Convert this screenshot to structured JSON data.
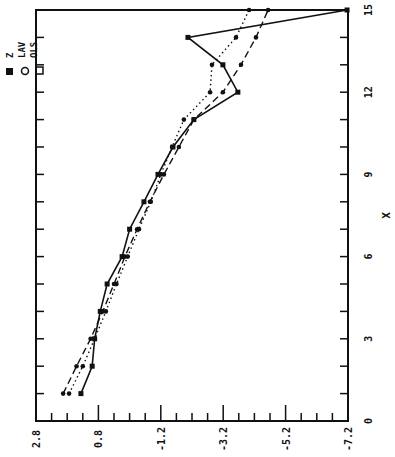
{
  "chart_data": {
    "type": "line",
    "orientation": "rotated-90",
    "title": "",
    "xlabel": "X",
    "ylabel": "",
    "xlim": [
      0,
      15
    ],
    "ylim": [
      2.8,
      -7.2
    ],
    "x_ticks": [
      "0",
      "3",
      "6",
      "9",
      "12",
      "15"
    ],
    "y_ticks": [
      "2.8",
      "0.8",
      "-1.2",
      "-3.2",
      "-5.2",
      "-7.2"
    ],
    "grid": false,
    "legend_position": "top-left",
    "x": [
      1,
      2,
      3,
      4,
      5,
      6,
      7,
      8,
      9,
      10,
      11,
      12,
      13,
      14,
      15
    ],
    "series": [
      {
        "name": "Z",
        "style": "solid",
        "marker": "filled-square",
        "values": [
          1.36,
          1.0,
          0.92,
          0.74,
          0.52,
          0.04,
          -0.2,
          -0.66,
          -1.11,
          -1.59,
          -2.26,
          -3.67,
          -3.19,
          -2.07,
          -7.17
        ]
      },
      {
        "name": "LAV",
        "style": "dashed",
        "marker": "circle",
        "values": [
          1.93,
          1.5,
          1.05,
          0.66,
          0.3,
          -0.05,
          -0.44,
          -0.85,
          -1.3,
          -1.78,
          -2.26,
          -3.19,
          -3.77,
          -4.25,
          -4.64
        ]
      },
      {
        "name": "OLS",
        "style": "dotted",
        "marker": "open-square",
        "values": [
          1.74,
          1.3,
          0.92,
          0.56,
          0.22,
          -0.14,
          -0.5,
          -0.88,
          -1.2,
          -1.56,
          -1.94,
          -2.78,
          -2.84,
          -3.61,
          -4.03
        ]
      }
    ]
  },
  "legend": {
    "items": [
      {
        "label": "Z"
      },
      {
        "label": "LAV"
      },
      {
        "label": "OLS"
      }
    ]
  },
  "axes": {
    "x_title": "X"
  }
}
